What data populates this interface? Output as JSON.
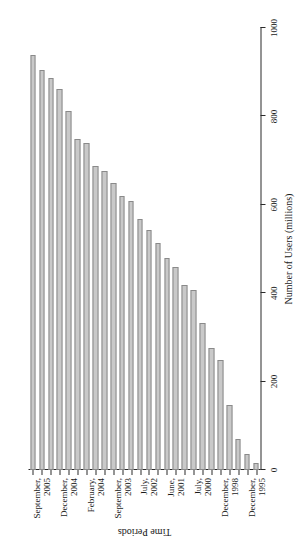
{
  "chart_data": {
    "type": "bar",
    "orientation": "horizontal",
    "title": "",
    "xlabel": "Number of Users (millions)",
    "ylabel": "Time Periods",
    "xlim": [
      0,
      1000
    ],
    "xticks": [
      0,
      200,
      400,
      600,
      800,
      1000
    ],
    "xtick_labels": [
      "0",
      "200",
      "400",
      "600",
      "800",
      "1000"
    ],
    "grid": false,
    "legend": false,
    "bar_color": "#c9c9c9",
    "bar_edge_color": "#8a8a8a",
    "axis_color": "#2a2a2a",
    "categories": [
      "December, 1995",
      "",
      "",
      "December, 1998",
      "",
      "",
      "July, 2000",
      "",
      "",
      "June, 2001",
      "",
      "",
      "July, 2002",
      "",
      "",
      "September, 2003",
      "",
      "",
      "February, 2004",
      "",
      "",
      "December, 2004",
      "",
      "",
      "September, 2005",
      ""
    ],
    "tick_labels_shown": [
      {
        "index": 0,
        "lines": [
          "December,",
          "1995"
        ]
      },
      {
        "index": 3,
        "lines": [
          "December,",
          "1998"
        ]
      },
      {
        "index": 6,
        "lines": [
          "July,",
          "2000"
        ]
      },
      {
        "index": 9,
        "lines": [
          "June,",
          "2001"
        ]
      },
      {
        "index": 12,
        "lines": [
          "July,",
          "2002"
        ]
      },
      {
        "index": 15,
        "lines": [
          "September,",
          "2003"
        ]
      },
      {
        "index": 18,
        "lines": [
          "February,",
          "2004"
        ]
      },
      {
        "index": 21,
        "lines": [
          "December,",
          "2004"
        ]
      },
      {
        "index": 24,
        "lines": [
          "September,",
          "2005"
        ]
      }
    ],
    "values": [
      16,
      36,
      70,
      147,
      248,
      276,
      333,
      407,
      419,
      459,
      479,
      513,
      544,
      569,
      608,
      620,
      649,
      677,
      688,
      740,
      748,
      813,
      863,
      888,
      905,
      938
    ]
  }
}
